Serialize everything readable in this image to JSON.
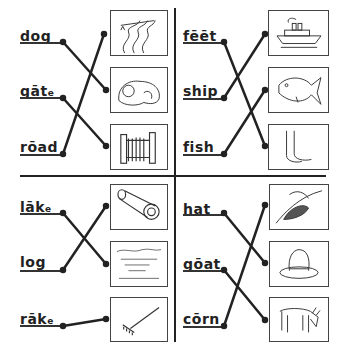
{
  "worksheet": {
    "instruction": "Match each word to its picture",
    "quadrants": [
      {
        "id": "top-left",
        "words": [
          {
            "text": "dog",
            "display": "dog",
            "suffix": ""
          },
          {
            "text": "gate",
            "display": "gāt",
            "suffix": "e"
          },
          {
            "text": "road",
            "display": "rōad",
            "suffix": ""
          }
        ],
        "pictures": [
          "road-icon",
          "dog-icon",
          "gate-icon"
        ],
        "matches": [
          [
            "dog",
            "dog-icon"
          ],
          [
            "gate",
            "gate-icon"
          ],
          [
            "road",
            "road-icon"
          ]
        ]
      },
      {
        "id": "top-right",
        "words": [
          {
            "text": "feet",
            "display": "fēēt",
            "suffix": ""
          },
          {
            "text": "ship",
            "display": "ship",
            "suffix": ""
          },
          {
            "text": "fish",
            "display": "fish",
            "suffix": ""
          }
        ],
        "pictures": [
          "ship-icon",
          "fish-icon",
          "feet-icon"
        ],
        "matches": [
          [
            "feet",
            "feet-icon"
          ],
          [
            "ship",
            "ship-icon"
          ],
          [
            "fish",
            "fish-icon"
          ]
        ]
      },
      {
        "id": "bottom-left",
        "words": [
          {
            "text": "lake",
            "display": "lāk",
            "suffix": "e"
          },
          {
            "text": "log",
            "display": "log",
            "suffix": ""
          },
          {
            "text": "rake",
            "display": "rāk",
            "suffix": "e"
          }
        ],
        "pictures": [
          "log-icon",
          "lake-icon",
          "rake-icon"
        ],
        "matches": [
          [
            "lake",
            "lake-icon"
          ],
          [
            "log",
            "log-icon"
          ],
          [
            "rake",
            "rake-icon"
          ]
        ]
      },
      {
        "id": "bottom-right",
        "words": [
          {
            "text": "hat",
            "display": "hat",
            "suffix": ""
          },
          {
            "text": "goat",
            "display": "gōat",
            "suffix": ""
          },
          {
            "text": "corn",
            "display": "cōrn",
            "suffix": ""
          }
        ],
        "pictures": [
          "corn-icon",
          "hat-icon",
          "goat-icon"
        ],
        "matches": [
          [
            "hat",
            "hat-icon"
          ],
          [
            "goat",
            "goat-icon"
          ],
          [
            "corn",
            "corn-icon"
          ]
        ]
      }
    ]
  },
  "colors": {
    "ink": "#222222",
    "paper": "#ffffff"
  }
}
